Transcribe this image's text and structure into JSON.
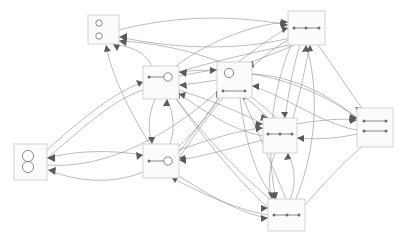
{
  "diagram": {
    "type": "directed-graph",
    "background_color": "#ffffff",
    "node_fill_color": "#fbfbfb",
    "node_border_color": "#c2c2c2",
    "edge_color": "#8e8e8e",
    "arrow_color": "#5a5a5a",
    "glyph_color": "#6e6e6e",
    "canvas": {
      "width": 402,
      "height": 238
    },
    "node_count": 9,
    "edge_count": 46,
    "nodes": [
      {
        "id": "n1",
        "name": "node-two-circles-separated",
        "glyph": "two-small-circles-stacked",
        "x": 88,
        "y": 15,
        "w": 31,
        "h": 29
      },
      {
        "id": "n2",
        "name": "node-two-circles-touching",
        "glyph": "figure-eight-circles",
        "x": 14,
        "y": 144,
        "w": 33,
        "h": 36
      },
      {
        "id": "n3",
        "name": "node-dot-line-circle-upper",
        "glyph": "dot-line-circle",
        "x": 143,
        "y": 66,
        "w": 36,
        "h": 33
      },
      {
        "id": "n4",
        "name": "node-circle-and-bar",
        "glyph": "circle-with-bar",
        "x": 217,
        "y": 62,
        "w": 35,
        "h": 36
      },
      {
        "id": "n5",
        "name": "node-bar-top-right",
        "glyph": "horizontal-bar-dots",
        "x": 288,
        "y": 11,
        "w": 37,
        "h": 34
      },
      {
        "id": "n6",
        "name": "node-double-bar-right",
        "glyph": "two-horizontal-bars",
        "x": 357,
        "y": 108,
        "w": 36,
        "h": 39
      },
      {
        "id": "n7",
        "name": "node-dot-line-circle-lower",
        "glyph": "dot-line-circle",
        "x": 143,
        "y": 144,
        "w": 36,
        "h": 34
      },
      {
        "id": "n8",
        "name": "node-bar-middle-right",
        "glyph": "horizontal-bar-dots",
        "x": 263,
        "y": 118,
        "w": 34,
        "h": 35
      },
      {
        "id": "n9",
        "name": "node-bar-bottom",
        "glyph": "horizontal-bar-dots",
        "x": 268,
        "y": 199,
        "w": 37,
        "h": 32
      }
    ],
    "edges": [
      {
        "from": "n1",
        "to": "n5",
        "curve": "arc-up"
      },
      {
        "from": "n5",
        "to": "n1",
        "curve": "arc-up"
      },
      {
        "from": "n3",
        "to": "n1",
        "curve": "straight"
      },
      {
        "from": "n7",
        "to": "n1",
        "curve": "straight"
      },
      {
        "from": "n4",
        "to": "n1",
        "curve": "arc"
      },
      {
        "from": "n2",
        "to": "n3",
        "curve": "arc"
      },
      {
        "from": "n3",
        "to": "n2",
        "curve": "arc"
      },
      {
        "from": "n2",
        "to": "n7",
        "curve": "arc"
      },
      {
        "from": "n7",
        "to": "n2",
        "curve": "arc"
      },
      {
        "from": "n3",
        "to": "n4",
        "curve": "straight"
      },
      {
        "from": "n4",
        "to": "n3",
        "curve": "straight"
      },
      {
        "from": "n3",
        "to": "n7",
        "curve": "arc-left"
      },
      {
        "from": "n7",
        "to": "n3",
        "curve": "arc-right"
      },
      {
        "from": "n3",
        "to": "n5",
        "curve": "arc"
      },
      {
        "from": "n5",
        "to": "n3",
        "curve": "arc"
      },
      {
        "from": "n3",
        "to": "n8",
        "curve": "arc"
      },
      {
        "from": "n8",
        "to": "n3",
        "curve": "arc"
      },
      {
        "from": "n3",
        "to": "n9",
        "curve": "arc"
      },
      {
        "from": "n9",
        "to": "n3",
        "curve": "arc"
      },
      {
        "from": "n3",
        "to": "n6",
        "curve": "arc"
      },
      {
        "from": "n4",
        "to": "n5",
        "curve": "arc"
      },
      {
        "from": "n5",
        "to": "n4",
        "curve": "arc"
      },
      {
        "from": "n4",
        "to": "n8",
        "curve": "straight"
      },
      {
        "from": "n8",
        "to": "n4",
        "curve": "straight"
      },
      {
        "from": "n4",
        "to": "n9",
        "curve": "arc"
      },
      {
        "from": "n9",
        "to": "n4",
        "curve": "arc"
      },
      {
        "from": "n4",
        "to": "n6",
        "curve": "arc"
      },
      {
        "from": "n6",
        "to": "n4",
        "curve": "arc"
      },
      {
        "from": "n4",
        "to": "n7",
        "curve": "straight"
      },
      {
        "from": "n7",
        "to": "n4",
        "curve": "straight"
      },
      {
        "from": "n5",
        "to": "n6",
        "curve": "straight"
      },
      {
        "from": "n5",
        "to": "n8",
        "curve": "arc"
      },
      {
        "from": "n8",
        "to": "n5",
        "curve": "arc"
      },
      {
        "from": "n5",
        "to": "n9",
        "curve": "arc"
      },
      {
        "from": "n9",
        "to": "n5",
        "curve": "arc"
      },
      {
        "from": "n5",
        "to": "n7",
        "curve": "arc"
      },
      {
        "from": "n8",
        "to": "n6",
        "curve": "straight"
      },
      {
        "from": "n6",
        "to": "n8",
        "curve": "straight"
      },
      {
        "from": "n8",
        "to": "n9",
        "curve": "arc-left"
      },
      {
        "from": "n9",
        "to": "n8",
        "curve": "arc-right"
      },
      {
        "from": "n8",
        "to": "n7",
        "curve": "arc"
      },
      {
        "from": "n7",
        "to": "n8",
        "curve": "arc"
      },
      {
        "from": "n9",
        "to": "n6",
        "curve": "straight"
      },
      {
        "from": "n9",
        "to": "n7",
        "curve": "arc"
      },
      {
        "from": "n7",
        "to": "n9",
        "curve": "arc"
      },
      {
        "from": "n2",
        "to": "n4",
        "curve": "arc"
      }
    ]
  }
}
